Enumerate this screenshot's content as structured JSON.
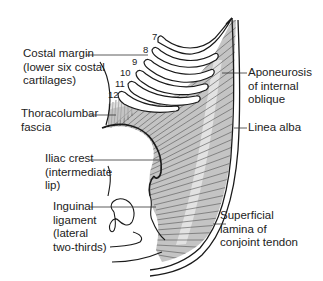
{
  "figure": {
    "colors": {
      "outline": "#1a1a1a",
      "muscle_fill": "#bdbdbd",
      "fiber_lines": "#6a6a6a",
      "aponeurosis_fill": "#d9d9d9",
      "background": "#ffffff",
      "text": "#222222"
    },
    "rib_numbers": [
      "7",
      "8",
      "9",
      "10",
      "11",
      "12"
    ],
    "labels": {
      "costal_margin": "Costal margin\n(lower six costal\ncartilages)",
      "thoracolumbar_fascia": "Thoracolumbar\nfascia",
      "iliac_crest": "Iliac crest\n(intermediate\nlip)",
      "inguinal_ligament": "Inguinal\nligament\n(lateral\ntwo-thirds)",
      "aponeurosis": "Aponeurosis\nof internal\noblique",
      "linea_alba": "Linea alba",
      "conjoint_tendon": "Superficial\nlamina of\nconjoint tendon"
    }
  }
}
